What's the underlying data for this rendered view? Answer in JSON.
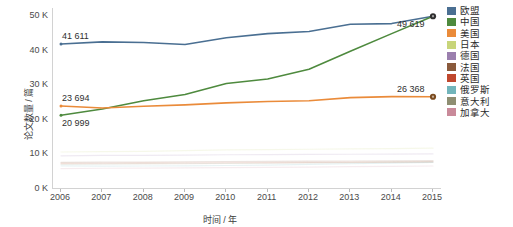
{
  "chart_data": {
    "type": "line",
    "title": "",
    "xlabel": "时间 / 年",
    "ylabel": "论文数量 / 篇",
    "x": [
      2006,
      2007,
      2008,
      2009,
      2010,
      2011,
      2012,
      2013,
      2014,
      2015
    ],
    "categories": [
      "2006",
      "2007",
      "2008",
      "2009",
      "2010",
      "2011",
      "2012",
      "2013",
      "2014",
      "2015"
    ],
    "ylim": [
      0,
      52000
    ],
    "yticks": [
      0,
      10000,
      20000,
      30000,
      40000,
      50000
    ],
    "ytick_labels": [
      "0 K",
      "10 K",
      "20 K",
      "30 K",
      "40 K",
      "50 K"
    ],
    "grid": false,
    "legend_position": "right",
    "series": [
      {
        "name": "欧盟",
        "color": "#4a6f92",
        "values": [
          41611,
          42200,
          42050,
          41450,
          43400,
          44600,
          45200,
          47300,
          47500,
          49619
        ]
      },
      {
        "name": "中国",
        "color": "#4e8a3e",
        "values": [
          20999,
          22800,
          25200,
          27000,
          30200,
          31500,
          34300,
          39500,
          44600,
          49619
        ]
      },
      {
        "name": "美国",
        "color": "#ea8b3a",
        "values": [
          23694,
          23100,
          23600,
          24000,
          24600,
          25000,
          25200,
          26100,
          26400,
          26368
        ]
      },
      {
        "name": "日本",
        "color": "#c8d57a",
        "values": [
          10400,
          10500,
          10600,
          10800,
          11000,
          11100,
          11200,
          11300,
          11400,
          11500
        ]
      },
      {
        "name": "德国",
        "color": "#9b7fae",
        "values": [
          9300,
          9400,
          9450,
          9500,
          9600,
          9650,
          9700,
          9750,
          9800,
          9850
        ]
      },
      {
        "name": "法国",
        "color": "#8a5a3c",
        "values": [
          7400,
          7450,
          7500,
          7550,
          7650,
          7700,
          7750,
          7800,
          7850,
          7900
        ]
      },
      {
        "name": "英国",
        "color": "#c0482e",
        "values": [
          7100,
          7150,
          7180,
          7220,
          7300,
          7350,
          7400,
          7450,
          7500,
          7550
        ]
      },
      {
        "name": "俄罗斯",
        "color": "#72b5bb",
        "values": [
          6400,
          6300,
          6350,
          6400,
          6500,
          6600,
          6800,
          7000,
          7200,
          7400
        ]
      },
      {
        "name": "意大利",
        "color": "#8e8e72",
        "values": [
          6800,
          6900,
          6950,
          7000,
          7100,
          7150,
          7250,
          7350,
          7450,
          7550
        ]
      },
      {
        "name": "加拿大",
        "color": "#c98a9a",
        "values": [
          5600,
          5700,
          5750,
          5800,
          5900,
          5950,
          6050,
          6150,
          6250,
          6350
        ]
      }
    ],
    "annotations": [
      {
        "text": "41 611",
        "series": "欧盟",
        "x": 2006,
        "y": 41611,
        "placement": "above-right"
      },
      {
        "text": "23 694",
        "series": "美国",
        "x": 2006,
        "y": 23694,
        "placement": "above-right"
      },
      {
        "text": "20 999",
        "series": "中国",
        "x": 2006,
        "y": 20999,
        "placement": "below-right"
      },
      {
        "text": "49 619",
        "series": "欧盟",
        "x": 2015,
        "y": 49619,
        "placement": "below-left"
      },
      {
        "text": "26 368",
        "series": "美国",
        "x": 2015,
        "y": 26368,
        "placement": "above-left"
      }
    ],
    "endpoint_markers": [
      {
        "series": "欧盟",
        "x": 2015,
        "y": 49619,
        "color": "#2f2f2f"
      },
      {
        "series": "美国",
        "x": 2015,
        "y": 26368,
        "color": "#7a4a1e"
      }
    ],
    "highlighted_series": [
      "欧盟",
      "中国",
      "美国"
    ],
    "faded_series": [
      "日本",
      "德国",
      "法国",
      "英国",
      "俄罗斯",
      "意大利",
      "加拿大"
    ]
  },
  "legend": {
    "items": [
      {
        "label": "欧盟",
        "color": "#4a6f92"
      },
      {
        "label": "中国",
        "color": "#4e8a3e"
      },
      {
        "label": "美国",
        "color": "#ea8b3a"
      },
      {
        "label": "日本",
        "color": "#c8d57a"
      },
      {
        "label": "德国",
        "color": "#9b7fae"
      },
      {
        "label": "法国",
        "color": "#8a5a3c"
      },
      {
        "label": "英国",
        "color": "#c0482e"
      },
      {
        "label": "俄罗斯",
        "color": "#72b5bb"
      },
      {
        "label": "意大利",
        "color": "#8e8e72"
      },
      {
        "label": "加拿大",
        "color": "#c98a9a"
      }
    ]
  }
}
